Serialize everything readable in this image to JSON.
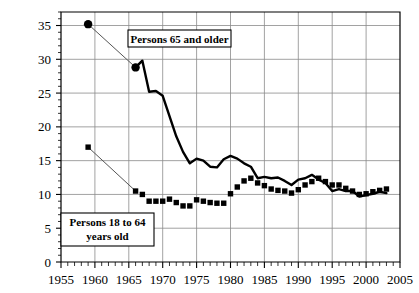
{
  "chart_data": {
    "type": "line",
    "title": "",
    "subtitle": "",
    "xlabel": "",
    "ylabel": "",
    "xlim": [
      1955,
      2005
    ],
    "ylim": [
      0,
      37
    ],
    "xticks": [
      1955,
      1960,
      1965,
      1970,
      1975,
      1980,
      1985,
      1990,
      1995,
      2000,
      2005
    ],
    "yticks": [
      0,
      5,
      10,
      15,
      20,
      25,
      30,
      35
    ],
    "xtick_labels": [
      "1955",
      "1960",
      "1965",
      "1970",
      "1975",
      "1980",
      "1985",
      "1990",
      "1995",
      "2000",
      "2005"
    ],
    "ytick_labels": [
      "0",
      "5",
      "10",
      "15",
      "20",
      "25",
      "30",
      "35"
    ],
    "x_minor_tick_step": 1,
    "y_minor_tick_step": 1,
    "grid": "horizontal-and-vertical-major",
    "legend_position": "inline-annotations",
    "series": [
      {
        "name": "Persons 65 and older",
        "marker": "circle",
        "style": "solid-thick-line-with-isolated-markers",
        "isolated_points": [
          {
            "x": 1959,
            "y": 35.2
          },
          {
            "x": 1966,
            "y": 28.8
          }
        ],
        "x": [
          1966,
          1967,
          1968,
          1969,
          1970,
          1971,
          1972,
          1973,
          1974,
          1975,
          1976,
          1977,
          1978,
          1979,
          1980,
          1981,
          1982,
          1983,
          1984,
          1985,
          1986,
          1987,
          1988,
          1989,
          1990,
          1991,
          1992,
          1993,
          1994,
          1995,
          1996,
          1997,
          1998,
          1999,
          2000,
          2001,
          2002,
          2003
        ],
        "values": [
          28.8,
          29.8,
          25.2,
          25.3,
          24.6,
          21.6,
          18.6,
          16.3,
          14.6,
          15.3,
          15.0,
          14.1,
          14.0,
          15.2,
          15.7,
          15.3,
          14.6,
          14.1,
          12.4,
          12.6,
          12.4,
          12.5,
          12.0,
          11.4,
          12.2,
          12.4,
          12.9,
          12.2,
          11.7,
          10.5,
          10.8,
          10.5,
          10.5,
          9.7,
          9.9,
          10.1,
          10.4,
          10.2
        ]
      },
      {
        "name": "Persons 18 to 64 years old",
        "marker": "square",
        "style": "markers-only",
        "isolated_points": [
          {
            "x": 1959,
            "y": 17.0
          }
        ],
        "x": [
          1966,
          1967,
          1968,
          1969,
          1970,
          1971,
          1972,
          1973,
          1974,
          1975,
          1976,
          1977,
          1978,
          1979,
          1980,
          1981,
          1982,
          1983,
          1984,
          1985,
          1986,
          1987,
          1988,
          1989,
          1990,
          1991,
          1992,
          1993,
          1994,
          1995,
          1996,
          1997,
          1998,
          1999,
          2000,
          2001,
          2002,
          2003
        ],
        "values": [
          10.5,
          10.0,
          9.0,
          9.0,
          9.0,
          9.3,
          8.8,
          8.3,
          8.3,
          9.2,
          9.0,
          8.8,
          8.7,
          8.7,
          10.1,
          11.1,
          12.0,
          12.4,
          11.7,
          11.3,
          10.8,
          10.6,
          10.5,
          10.2,
          10.7,
          11.4,
          11.9,
          12.4,
          11.9,
          11.4,
          11.4,
          10.9,
          10.5,
          10.0,
          10.1,
          10.4,
          10.6,
          10.8
        ]
      }
    ],
    "annotations": [
      {
        "name": "Persons 65 and older",
        "text": "Persons 65 and older"
      },
      {
        "name": "Persons 18 to 64 years old",
        "line1": "Persons 18 to 64",
        "line2": "years old"
      }
    ],
    "colors": {
      "series_line": "#000000",
      "marker": "#000000",
      "grid": "#8a8a8a",
      "axis": "#000000",
      "background": "#ffffff"
    }
  }
}
